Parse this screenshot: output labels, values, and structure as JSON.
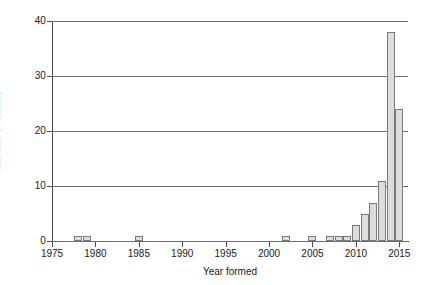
{
  "chart_data": {
    "type": "bar",
    "title": "",
    "xlabel": "Year formed",
    "ylabel": "Number of entities",
    "xlim": [
      1975,
      2016
    ],
    "ylim": [
      0,
      40
    ],
    "yticks": [
      0,
      10,
      20,
      30,
      40
    ],
    "xticks": [
      1975,
      1980,
      1985,
      1990,
      1995,
      2000,
      2005,
      2010,
      2015
    ],
    "grid": "horizontal",
    "legend": "none",
    "bar_fill": "#dcdcdc",
    "bar_stroke": "#7a7a7a",
    "categories": [
      1978,
      1979,
      1985,
      2002,
      2005,
      2007,
      2008,
      2009,
      2010,
      2011,
      2012,
      2013,
      2014,
      2015
    ],
    "values": [
      1,
      1,
      1,
      1,
      1,
      1,
      1,
      1,
      3,
      5,
      7,
      11,
      38,
      24
    ]
  }
}
